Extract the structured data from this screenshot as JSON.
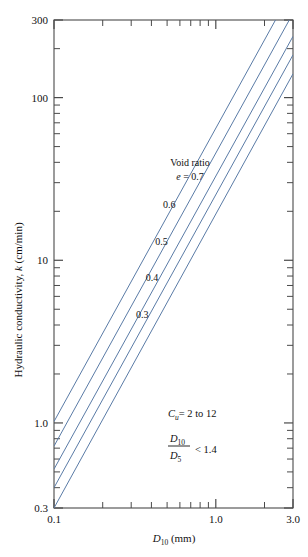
{
  "chart_data": {
    "type": "line",
    "title": "",
    "xlabel": "D10 (mm)",
    "xlabel_main": "D",
    "xlabel_sub": "10",
    "xlabel_unit": " (mm)",
    "ylabel": "Hydraulic conductivity, k (cm/min)",
    "ylabel_pre": "Hydraulic conductivity, ",
    "ylabel_sym": "k",
    "ylabel_post": " (cm/min)",
    "xscale": "log",
    "yscale": "log",
    "xlim": [
      0.1,
      3.0
    ],
    "ylim": [
      0.3,
      300
    ],
    "grid": false,
    "legend_position": "inline-curve-labels",
    "x_tick_labels": [
      "0.1",
      "1.0",
      "3.0"
    ],
    "x_tick_values": [
      0.1,
      1.0,
      3.0
    ],
    "y_tick_labels": [
      "300",
      "100",
      "10",
      "1.0",
      "0.3"
    ],
    "y_tick_values": [
      300,
      100,
      10,
      1.0,
      0.3
    ],
    "x_minor_ticks": [
      0.2,
      0.3,
      0.4,
      0.5,
      0.6,
      0.7,
      0.8,
      0.9,
      2.0
    ],
    "y_minor_ticks": [
      0.4,
      0.5,
      0.6,
      0.7,
      0.8,
      0.9,
      2,
      3,
      4,
      5,
      6,
      7,
      8,
      9,
      20,
      30,
      40,
      50,
      60,
      70,
      80,
      90,
      200
    ],
    "series_group_label": "Void ratio",
    "series_symbol": "e",
    "series": [
      {
        "name": "0.7",
        "label": "e = 0.7",
        "x": [
          0.1,
          3.0
        ],
        "y": [
          1.02,
          470
        ],
        "x_at_ymin": 0.1,
        "y_at_xmax": 470
      },
      {
        "name": "0.6",
        "label": "0.6",
        "x": [
          0.1,
          3.0
        ],
        "y": [
          0.72,
          330
        ]
      },
      {
        "name": "0.5",
        "label": "0.5",
        "x": [
          0.1,
          3.0
        ],
        "y": [
          0.52,
          238
        ]
      },
      {
        "name": "0.4",
        "label": "0.4",
        "x": [
          0.1,
          3.0
        ],
        "y": [
          0.4,
          183
        ]
      },
      {
        "name": "0.3",
        "label": "0.3",
        "x": [
          0.1,
          3.0
        ],
        "y": [
          0.3,
          140
        ]
      }
    ],
    "annotations": [
      {
        "id": "cu",
        "text": "Cu = 2 to 12",
        "sym": "C",
        "sub": "u",
        "rest": "= 2 to 12"
      },
      {
        "id": "d-ratio",
        "text": "D10 / D5 < 1.4",
        "num_sym": "D",
        "num_sub": "10",
        "den_sym": "D",
        "den_sub": "5",
        "rest": "< 1.4"
      }
    ]
  },
  "figure": {
    "curve_color": "#5a7ba6",
    "axis_color": "#4a4a4a",
    "background": "#ffffff"
  }
}
